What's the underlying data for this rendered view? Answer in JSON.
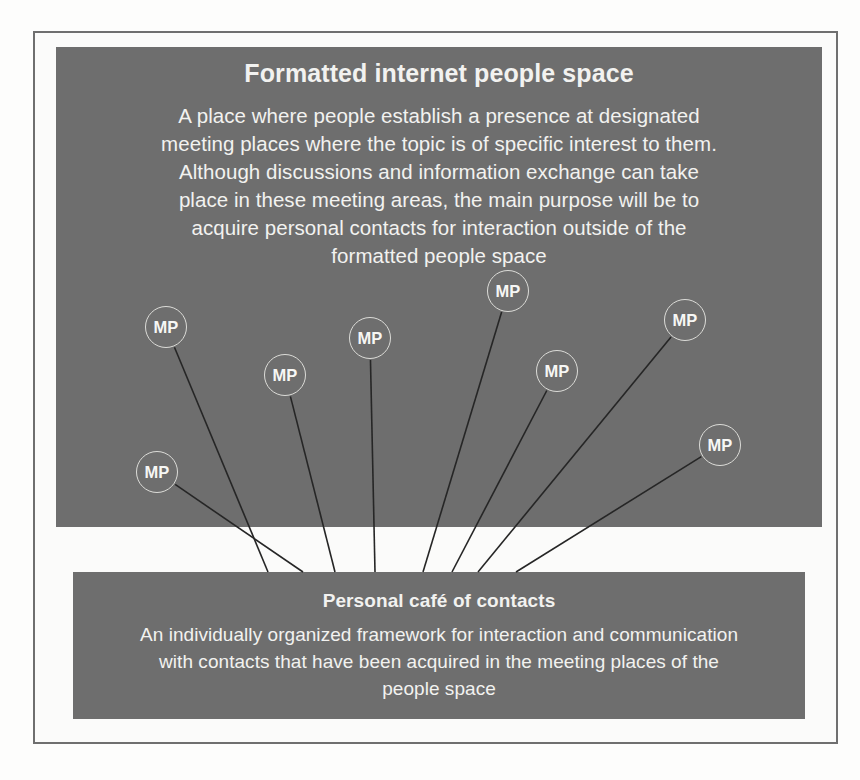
{
  "diagram": {
    "top_panel": {
      "title": "Formatted internet people space",
      "body": "A place where people establish a presence at designated meeting places where the topic is of specific interest to them. Although discussions and information exchange can take place in these meeting areas, the main purpose will be to acquire personal contacts for interaction outside of the formatted people space"
    },
    "bottom_panel": {
      "title": "Personal café of contacts",
      "body": "An individually organized framework for interaction and communication with contacts that have been acquired in the meeting places of the people space"
    },
    "node_label": "MP",
    "nodes": [
      {
        "id": "mp-1",
        "label": "MP",
        "cx": 166,
        "cy": 327,
        "r": 21,
        "link_x": 268,
        "link_y": 572
      },
      {
        "id": "mp-2",
        "label": "MP",
        "cx": 157,
        "cy": 472,
        "r": 21,
        "link_x": 303,
        "link_y": 572
      },
      {
        "id": "mp-3",
        "label": "MP",
        "cx": 285,
        "cy": 375,
        "r": 21,
        "link_x": 335,
        "link_y": 572
      },
      {
        "id": "mp-4",
        "label": "MP",
        "cx": 370,
        "cy": 338,
        "r": 21,
        "link_x": 375,
        "link_y": 572
      },
      {
        "id": "mp-5",
        "label": "MP",
        "cx": 508,
        "cy": 291,
        "r": 21,
        "link_x": 423,
        "link_y": 572
      },
      {
        "id": "mp-6",
        "label": "MP",
        "cx": 557,
        "cy": 371,
        "r": 21,
        "link_x": 452,
        "link_y": 572
      },
      {
        "id": "mp-7",
        "label": "MP",
        "cx": 685,
        "cy": 320,
        "r": 21,
        "link_x": 478,
        "link_y": 572
      },
      {
        "id": "mp-8",
        "label": "MP",
        "cx": 720,
        "cy": 445,
        "r": 21,
        "link_x": 516,
        "link_y": 572
      }
    ],
    "colors": {
      "panel_fill": "#6e6e6e",
      "panel_text": "#f2f2f0",
      "node_stroke": "#dcdcd8",
      "link_stroke": "#262626",
      "frame_stroke": "#6f6f6f",
      "page_background": "#fbfbfa"
    }
  }
}
